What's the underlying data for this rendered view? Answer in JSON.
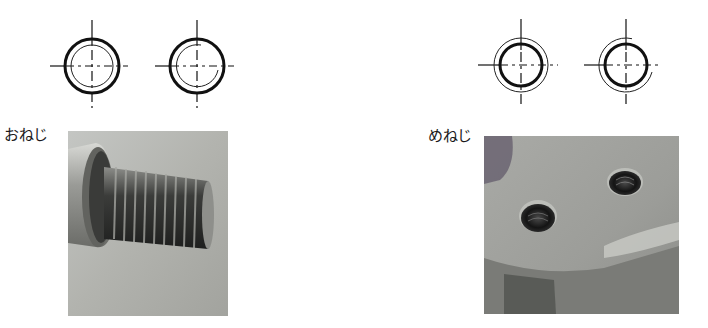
{
  "external_thread": {
    "label": "おねじ",
    "symbols": [
      {
        "name": "external-thread-symbol-full",
        "cx": 92,
        "cy": 66,
        "thick_r": 27,
        "thin_r": 21,
        "thin_full": true
      },
      {
        "name": "external-thread-symbol-partial",
        "cx": 197,
        "cy": 66,
        "thick_r": 27,
        "thin_r": 21,
        "thin_full": false
      }
    ],
    "photo": {
      "description": "threaded bolt photo"
    }
  },
  "internal_thread": {
    "label": "めねじ",
    "symbols": [
      {
        "name": "internal-thread-symbol-full",
        "cx": 521,
        "cy": 65,
        "thick_r": 21,
        "thin_r": 27,
        "thin_full": true
      },
      {
        "name": "internal-thread-symbol-partial",
        "cx": 626,
        "cy": 65,
        "thick_r": 21,
        "thin_r": 27,
        "thin_full": false
      }
    ],
    "photo": {
      "description": "tapped holes in metal part photo"
    }
  },
  "colors": {
    "line": "#111111",
    "photo_bg_light": "#b9b9b6",
    "photo_bg_dark": "#7f807c"
  }
}
